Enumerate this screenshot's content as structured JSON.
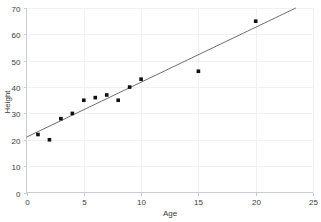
{
  "chart_data": {
    "type": "scatter",
    "title": "",
    "xlabel": "Age",
    "ylabel": "Height",
    "xlim": [
      0,
      25
    ],
    "ylim": [
      0,
      70
    ],
    "xticks": [
      0,
      5,
      10,
      15,
      20,
      25
    ],
    "yticks": [
      0,
      10,
      20,
      30,
      40,
      50,
      60,
      70
    ],
    "grid": true,
    "legend": "none",
    "x": [
      1,
      2,
      3,
      4,
      5,
      6,
      7,
      8,
      9,
      10,
      15,
      20
    ],
    "y": [
      22,
      20,
      28,
      30,
      35,
      36,
      37,
      35,
      40,
      43,
      46,
      65
    ],
    "points": [
      {
        "x": 1,
        "y": 22
      },
      {
        "x": 2,
        "y": 20
      },
      {
        "x": 3,
        "y": 28
      },
      {
        "x": 4,
        "y": 30
      },
      {
        "x": 5,
        "y": 35
      },
      {
        "x": 6,
        "y": 36
      },
      {
        "x": 7,
        "y": 37
      },
      {
        "x": 8,
        "y": 35
      },
      {
        "x": 9,
        "y": 40
      },
      {
        "x": 10,
        "y": 43
      },
      {
        "x": 15,
        "y": 46
      },
      {
        "x": 20,
        "y": 65
      }
    ],
    "series": [
      {
        "name": "observations",
        "type": "scatter",
        "values": [
          22,
          20,
          28,
          30,
          35,
          36,
          37,
          35,
          40,
          43,
          46,
          65
        ]
      },
      {
        "name": "trendline",
        "type": "line",
        "x": [
          0,
          23.5
        ],
        "y": [
          21,
          70
        ]
      }
    ],
    "trendline": {
      "x_start": 0,
      "y_start": 21,
      "x_end": 23.5,
      "y_end": 70,
      "slope": 2.085,
      "intercept": 21
    }
  },
  "axes": {
    "x_tick_labels": [
      "0",
      "5",
      "10",
      "15",
      "20",
      "25"
    ],
    "y_tick_labels": [
      "0",
      "10",
      "20",
      "30",
      "40",
      "50",
      "60",
      "70"
    ],
    "x_axis_title": "Age",
    "y_axis_title": "Height"
  },
  "colors": {
    "background": "#ffffff",
    "grid": "#eef1f5",
    "axis": "#c9cdd2",
    "point": "#101010",
    "line": "#6f6f6f",
    "text": "#3b3b3b"
  }
}
